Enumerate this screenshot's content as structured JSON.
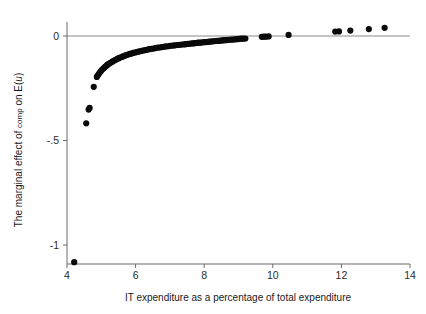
{
  "chart_data": {
    "type": "scatter",
    "title": "",
    "xlabel": "IT expenditure as a percentage of total expenditure",
    "ylabel_parts": {
      "prefix": "The marginal effect of ",
      "variable": "comp",
      "middle": " on E(",
      "italic": "u",
      "suffix": ")"
    },
    "ylabel": "The marginal effect of comp on E(u)",
    "xlim": [
      4,
      14
    ],
    "ylim": [
      -1.15,
      0.12
    ],
    "xticks": [
      4,
      6,
      8,
      10,
      12,
      14
    ],
    "xtick_labels": [
      "4",
      "6",
      "8",
      "10",
      "12",
      "14"
    ],
    "yticks": [
      0,
      -0.5,
      -1
    ],
    "ytick_labels": [
      "0",
      "-.5",
      "-1"
    ],
    "grid": false,
    "legend": "none",
    "reference_lines": [
      {
        "axis": "y",
        "value": 0,
        "color": "#8a8a8a"
      }
    ],
    "marker": {
      "shape": "circle",
      "color": "#0a0a0a",
      "size": 3.1
    },
    "series": [
      {
        "name": "marginal effect",
        "points": [
          [
            4.21,
            -1.082
          ],
          [
            4.56,
            -0.418
          ],
          [
            4.63,
            -0.352
          ],
          [
            4.66,
            -0.344
          ],
          [
            4.78,
            -0.243
          ],
          [
            4.87,
            -0.196
          ],
          [
            4.9,
            -0.188
          ],
          [
            4.93,
            -0.181
          ],
          [
            4.96,
            -0.174
          ],
          [
            4.99,
            -0.168
          ],
          [
            5.02,
            -0.162
          ],
          [
            5.06,
            -0.156
          ],
          [
            5.09,
            -0.151
          ],
          [
            5.12,
            -0.146
          ],
          [
            5.16,
            -0.141
          ],
          [
            5.19,
            -0.136
          ],
          [
            5.23,
            -0.132
          ],
          [
            5.27,
            -0.128
          ],
          [
            5.31,
            -0.124
          ],
          [
            5.35,
            -0.12
          ],
          [
            5.39,
            -0.116
          ],
          [
            5.43,
            -0.113
          ],
          [
            5.47,
            -0.109
          ],
          [
            5.51,
            -0.106
          ],
          [
            5.55,
            -0.103
          ],
          [
            5.6,
            -0.1
          ],
          [
            5.64,
            -0.097
          ],
          [
            5.69,
            -0.094
          ],
          [
            5.73,
            -0.091
          ],
          [
            5.78,
            -0.089
          ],
          [
            5.83,
            -0.086
          ],
          [
            5.88,
            -0.084
          ],
          [
            5.93,
            -0.081
          ],
          [
            5.98,
            -0.079
          ],
          [
            6.03,
            -0.077
          ],
          [
            6.08,
            -0.075
          ],
          [
            6.13,
            -0.073
          ],
          [
            6.18,
            -0.071
          ],
          [
            6.24,
            -0.069
          ],
          [
            6.29,
            -0.067
          ],
          [
            6.35,
            -0.065
          ],
          [
            6.4,
            -0.063
          ],
          [
            6.46,
            -0.061
          ],
          [
            6.52,
            -0.06
          ],
          [
            6.58,
            -0.058
          ],
          [
            6.64,
            -0.056
          ],
          [
            6.7,
            -0.055
          ],
          [
            6.76,
            -0.053
          ],
          [
            6.82,
            -0.052
          ],
          [
            6.88,
            -0.05
          ],
          [
            6.95,
            -0.049
          ],
          [
            7.01,
            -0.047
          ],
          [
            7.08,
            -0.046
          ],
          [
            7.14,
            -0.045
          ],
          [
            7.21,
            -0.043
          ],
          [
            7.28,
            -0.042
          ],
          [
            7.35,
            -0.041
          ],
          [
            7.42,
            -0.04
          ],
          [
            7.46,
            -0.039
          ],
          [
            7.52,
            -0.038
          ],
          [
            7.57,
            -0.037
          ],
          [
            7.61,
            -0.036
          ],
          [
            7.66,
            -0.035
          ],
          [
            7.7,
            -0.035
          ],
          [
            7.74,
            -0.034
          ],
          [
            7.79,
            -0.033
          ],
          [
            7.83,
            -0.032
          ],
          [
            7.88,
            -0.032
          ],
          [
            7.92,
            -0.031
          ],
          [
            7.97,
            -0.03
          ],
          [
            8.01,
            -0.029
          ],
          [
            8.06,
            -0.029
          ],
          [
            8.11,
            -0.028
          ],
          [
            8.16,
            -0.027
          ],
          [
            8.22,
            -0.026
          ],
          [
            8.28,
            -0.025
          ],
          [
            8.33,
            -0.024
          ],
          [
            8.38,
            -0.023
          ],
          [
            8.43,
            -0.023
          ],
          [
            8.48,
            -0.022
          ],
          [
            8.53,
            -0.021
          ],
          [
            8.58,
            -0.02
          ],
          [
            8.63,
            -0.02
          ],
          [
            8.68,
            -0.019
          ],
          [
            8.73,
            -0.018
          ],
          [
            8.79,
            -0.017
          ],
          [
            8.84,
            -0.017
          ],
          [
            8.9,
            -0.016
          ],
          [
            8.96,
            -0.015
          ],
          [
            9.02,
            -0.014
          ],
          [
            9.08,
            -0.013
          ],
          [
            9.14,
            -0.013
          ],
          [
            9.2,
            -0.012
          ],
          [
            9.68,
            -0.004
          ],
          [
            9.74,
            -0.003
          ],
          [
            9.8,
            -0.003
          ],
          [
            9.88,
            -0.002
          ],
          [
            10.46,
            0.005
          ],
          [
            11.82,
            0.021
          ],
          [
            11.93,
            0.022
          ],
          [
            12.26,
            0.026
          ],
          [
            12.8,
            0.033
          ],
          [
            13.26,
            0.039
          ]
        ]
      }
    ]
  }
}
